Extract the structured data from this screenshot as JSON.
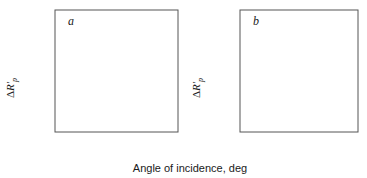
{
  "figure": {
    "xlabel": "Angle of incidence, deg",
    "ylabel_delta": "Δ",
    "ylabel_symbol": "R′",
    "ylabel_subscript": "p",
    "curve_color": "#000000",
    "axis_color": "#555555"
  },
  "panels": [
    {
      "letter": "a",
      "xticklabels": [
        "40",
        "60",
        "80"
      ],
      "yticklabels": [
        "0.00",
        "0.05",
        "0.10",
        "0.15"
      ],
      "curve_labels": [
        "1",
        "2",
        "3",
        "4",
        "5"
      ]
    },
    {
      "letter": "b",
      "xticklabels": [
        "0",
        "20",
        "40",
        "60",
        "80"
      ],
      "yticklabels": [
        "0.0",
        "0.3",
        "0.6"
      ],
      "curve_labels": [
        "1",
        "2",
        "3",
        "4",
        "5",
        "6"
      ]
    }
  ],
  "chart_data": [
    {
      "type": "line",
      "panel": "a",
      "title": "a",
      "xlabel": "Angle of incidence, deg",
      "ylabel": "ΔR′p",
      "xlim": [
        30,
        90
      ],
      "ylim": [
        0.0,
        0.168
      ],
      "xticks": [
        40,
        60,
        80
      ],
      "yticks": [
        0.0,
        0.05,
        0.1,
        0.15
      ],
      "grid": false,
      "legend": "inline curve numbers",
      "series": [
        {
          "name": "1",
          "label_xy": [
            89.0,
            0.019
          ],
          "x": [
            30,
            40,
            50,
            60,
            70,
            75,
            80,
            83,
            85,
            86,
            87,
            88,
            88.6,
            89.2,
            90
          ],
          "y": [
            0.0005,
            0.0008,
            0.0012,
            0.0018,
            0.0028,
            0.0035,
            0.0045,
            0.0053,
            0.006,
            0.0063,
            0.0065,
            0.0062,
            0.0052,
            0.003,
            0.0
          ]
        },
        {
          "name": "2",
          "label_xy": [
            85.5,
            0.03
          ],
          "x": [
            30,
            40,
            50,
            60,
            70,
            75,
            80,
            83,
            85,
            86.5,
            87.5,
            88.2,
            88.8,
            89.4,
            90
          ],
          "y": [
            0.0015,
            0.0022,
            0.0033,
            0.005,
            0.008,
            0.0105,
            0.014,
            0.017,
            0.0195,
            0.0205,
            0.02,
            0.018,
            0.014,
            0.0075,
            0.0
          ]
        },
        {
          "name": "3",
          "label_xy": [
            83.0,
            0.058
          ],
          "x": [
            30,
            40,
            50,
            60,
            70,
            75,
            80,
            83,
            85,
            86,
            87,
            87.8,
            88.4,
            89.2,
            90
          ],
          "y": [
            0.0035,
            0.0055,
            0.0085,
            0.0135,
            0.0225,
            0.03,
            0.04,
            0.049,
            0.056,
            0.0588,
            0.0592,
            0.056,
            0.047,
            0.025,
            0.0
          ]
        },
        {
          "name": "4",
          "label_xy": [
            78.5,
            0.112
          ],
          "x": [
            30,
            40,
            50,
            60,
            65,
            70,
            75,
            80,
            83,
            85,
            86,
            86.8,
            87.6,
            88.4,
            89.2,
            90
          ],
          "y": [
            0.0075,
            0.012,
            0.0195,
            0.032,
            0.0415,
            0.0545,
            0.0715,
            0.092,
            0.1055,
            0.114,
            0.1165,
            0.115,
            0.106,
            0.087,
            0.047,
            0.0
          ]
        },
        {
          "name": "5",
          "label_xy": [
            75.0,
            0.135
          ],
          "x": [
            30,
            40,
            50,
            60,
            65,
            70,
            75,
            80,
            83,
            85,
            86,
            86.8,
            87.5,
            88.3,
            89.1,
            90
          ],
          "y": [
            0.012,
            0.0195,
            0.031,
            0.05,
            0.0635,
            0.08,
            0.101,
            0.126,
            0.142,
            0.152,
            0.155,
            0.154,
            0.145,
            0.121,
            0.068,
            0.0
          ]
        }
      ]
    },
    {
      "type": "line",
      "panel": "b",
      "title": "b",
      "xlabel": "Angle of incidence, deg",
      "ylabel": "ΔR′p",
      "xlim": [
        0,
        90
      ],
      "ylim": [
        0.0,
        0.8
      ],
      "xticks": [
        0,
        20,
        40,
        60,
        80
      ],
      "yticks": [
        0.0,
        0.3,
        0.6
      ],
      "grid": false,
      "legend": "inline curve numbers",
      "series": [
        {
          "name": "1",
          "label_xy": [
            82.0,
            0.195
          ],
          "x": [
            0,
            10,
            20,
            30,
            40,
            50,
            60,
            70,
            78,
            83,
            86,
            87.5,
            88.5,
            89.3,
            90
          ],
          "y": [
            0.0,
            0.002,
            0.006,
            0.013,
            0.024,
            0.04,
            0.063,
            0.098,
            0.135,
            0.152,
            0.153,
            0.145,
            0.115,
            0.055,
            0.0
          ]
        },
        {
          "name": "2",
          "label_xy": [
            74.0,
            0.43
          ],
          "x": [
            0,
            10,
            20,
            30,
            40,
            50,
            60,
            68,
            75,
            80,
            83,
            85.5,
            87,
            88,
            89,
            90
          ],
          "y": [
            0.0,
            0.006,
            0.022,
            0.05,
            0.093,
            0.155,
            0.24,
            0.33,
            0.405,
            0.44,
            0.452,
            0.448,
            0.425,
            0.385,
            0.24,
            0.0
          ]
        },
        {
          "name": "3",
          "label_xy": [
            71.0,
            0.49
          ],
          "x": [
            0,
            10,
            20,
            30,
            40,
            50,
            58,
            65,
            72,
            77,
            81,
            84,
            86,
            87.5,
            88.6,
            89.4,
            90
          ],
          "y": [
            0.0,
            0.012,
            0.042,
            0.092,
            0.168,
            0.272,
            0.375,
            0.47,
            0.552,
            0.592,
            0.605,
            0.598,
            0.572,
            0.52,
            0.42,
            0.23,
            0.0
          ]
        },
        {
          "name": "4",
          "label_xy": [
            62.0,
            0.61
          ],
          "x": [
            0,
            8,
            16,
            25,
            34,
            42,
            50,
            57,
            64,
            70,
            75,
            79,
            82.5,
            85,
            86.8,
            88,
            89,
            90
          ],
          "y": [
            0.0,
            0.016,
            0.055,
            0.118,
            0.2,
            0.283,
            0.375,
            0.455,
            0.53,
            0.585,
            0.622,
            0.64,
            0.645,
            0.638,
            0.618,
            0.58,
            0.42,
            0.0
          ]
        },
        {
          "name": "5",
          "label_xy": [
            66.5,
            0.672
          ],
          "x": [
            0,
            6,
            13,
            20,
            28,
            36,
            44,
            52,
            58,
            64,
            70,
            75,
            79,
            82,
            84.5,
            86.5,
            88,
            89,
            90
          ],
          "y": [
            0.0,
            0.02,
            0.068,
            0.128,
            0.212,
            0.3,
            0.39,
            0.48,
            0.545,
            0.605,
            0.655,
            0.685,
            0.697,
            0.695,
            0.682,
            0.655,
            0.6,
            0.45,
            0.0
          ]
        },
        {
          "name": "6",
          "label_xy": [
            60.0,
            0.755
          ],
          "x": [
            0,
            5,
            11,
            18,
            25,
            33,
            41,
            49,
            56,
            62,
            68,
            73,
            77,
            80.5,
            83.5,
            86,
            87.8,
            89,
            90
          ],
          "y": [
            0.0,
            0.024,
            0.078,
            0.155,
            0.238,
            0.34,
            0.44,
            0.54,
            0.62,
            0.685,
            0.725,
            0.735,
            0.728,
            0.712,
            0.688,
            0.65,
            0.595,
            0.47,
            0.0
          ]
        }
      ]
    }
  ]
}
